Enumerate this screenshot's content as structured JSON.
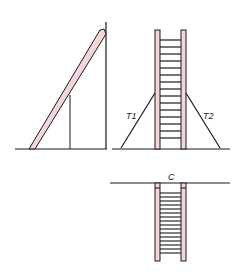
{
  "diagram": {
    "colors": {
      "line": "#1a1a1a",
      "rail_fill": "#f2d6d8",
      "background": "#ffffff"
    },
    "panels": [
      {
        "id": "leaning-ladder",
        "description": "Ladder leaning against a vertical wall with a vertical support line"
      },
      {
        "id": "freestanding-ladder",
        "description": "Vertical ladder supported by two guy lines",
        "labels": {
          "left_tether": "T1",
          "right_tether": "T2"
        },
        "rungs": 15
      },
      {
        "id": "hanging-ladder",
        "description": "Ladder hanging below a horizontal line",
        "labels": {
          "top": "C"
        },
        "rungs": 17
      }
    ]
  }
}
